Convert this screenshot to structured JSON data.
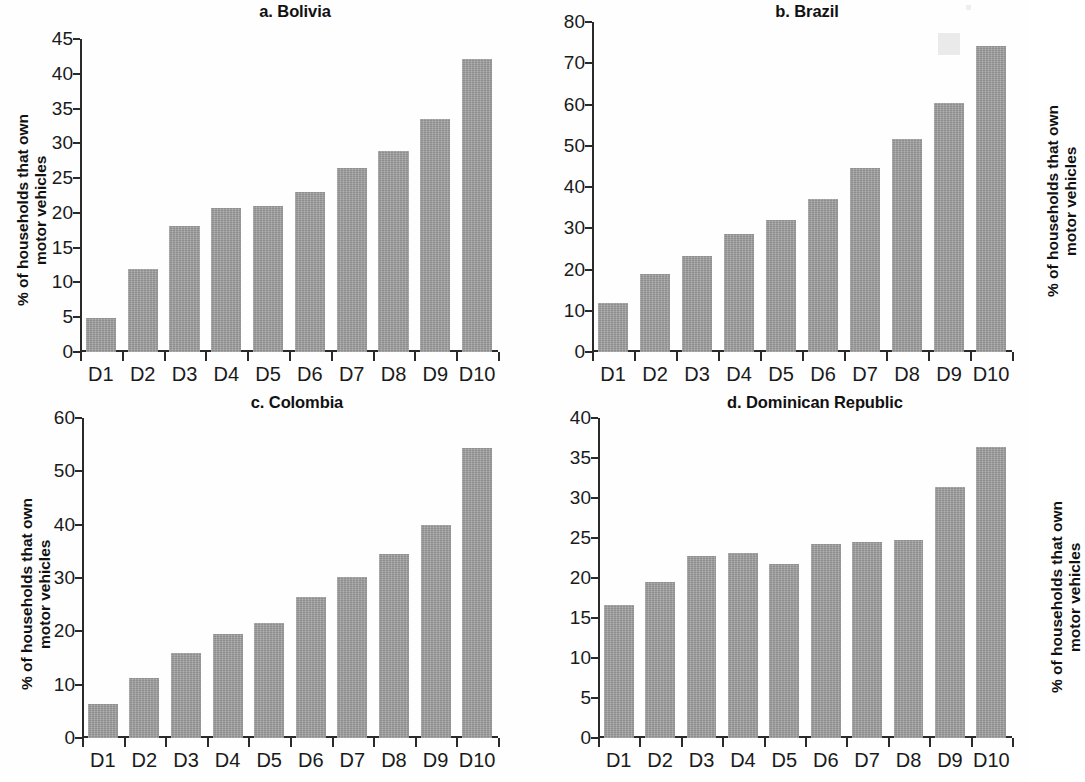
{
  "figure": {
    "background_color": "#ffffff",
    "bar_color": "#9c9c9c",
    "axis_color": "#2a2a2a",
    "ylabel_line1": "% of households that own",
    "ylabel_line2": "motor vehicles"
  },
  "chart_data": [
    {
      "type": "bar",
      "title": "a. Bolivia",
      "panel_letter": "a",
      "country": "Bolivia",
      "categories": [
        "D1",
        "D2",
        "D3",
        "D4",
        "D5",
        "D6",
        "D7",
        "D8",
        "D9",
        "D10"
      ],
      "values": [
        4.9,
        12.0,
        18.1,
        20.7,
        21.0,
        23.0,
        26.4,
        28.9,
        33.5,
        42.1
      ],
      "xlabel": "",
      "ylabel": "% of households that own motor vehicles",
      "ylim": [
        0,
        45
      ],
      "yticks": [
        0,
        5,
        10,
        15,
        20,
        25,
        30,
        35,
        40,
        45
      ],
      "grid": false,
      "legend": "none"
    },
    {
      "type": "bar",
      "title": "b. Brazil",
      "panel_letter": "b",
      "country": "Brazil",
      "categories": [
        "D1",
        "D2",
        "D3",
        "D4",
        "D5",
        "D6",
        "D7",
        "D8",
        "D9",
        "D10"
      ],
      "values": [
        12.0,
        18.8,
        23.3,
        28.5,
        32.0,
        37.0,
        44.5,
        51.6,
        60.4,
        74.3
      ],
      "xlabel": "",
      "ylabel": "% of households that own motor vehicles",
      "ylim": [
        0,
        80
      ],
      "yticks": [
        0,
        10,
        20,
        30,
        40,
        50,
        60,
        70,
        80
      ],
      "grid": false,
      "legend": "none"
    },
    {
      "type": "bar",
      "title": "c. Colombia",
      "panel_letter": "c",
      "country": "Colombia",
      "categories": [
        "D1",
        "D2",
        "D3",
        "D4",
        "D5",
        "D6",
        "D7",
        "D8",
        "D9",
        "D10"
      ],
      "values": [
        6.4,
        11.2,
        16.0,
        19.5,
        21.5,
        26.5,
        30.2,
        34.5,
        40.0,
        54.3
      ],
      "xlabel": "",
      "ylabel": "% of households that own motor vehicles",
      "ylim": [
        0,
        60
      ],
      "yticks": [
        0,
        10,
        20,
        30,
        40,
        50,
        60
      ],
      "grid": false,
      "legend": "none"
    },
    {
      "type": "bar",
      "title": "d. Dominican Republic",
      "panel_letter": "d",
      "country": "Dominican Republic",
      "categories": [
        "D1",
        "D2",
        "D3",
        "D4",
        "D5",
        "D6",
        "D7",
        "D8",
        "D9",
        "D10"
      ],
      "values": [
        16.6,
        19.5,
        22.8,
        23.1,
        21.7,
        24.2,
        24.5,
        24.8,
        31.4,
        36.4
      ],
      "xlabel": "",
      "ylabel": "% of households that own motor vehicles",
      "ylim": [
        0,
        40
      ],
      "yticks": [
        0,
        5,
        10,
        15,
        20,
        25,
        30,
        35,
        40
      ],
      "grid": false,
      "legend": "none"
    }
  ]
}
